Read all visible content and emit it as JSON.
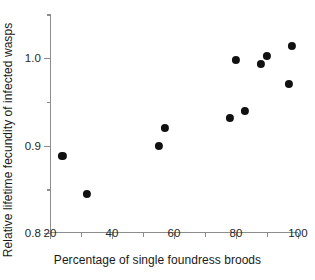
{
  "chart_data": {
    "type": "scatter",
    "title": "",
    "xlabel": "Percentage of single foundress broods",
    "ylabel": "Relative lifetime fecundity of infected wasps",
    "xlim": [
      20,
      100
    ],
    "ylim": [
      0.8,
      1.05
    ],
    "grid": false,
    "legend": null,
    "x_ticks_major": [
      20,
      40,
      60,
      80,
      100
    ],
    "x_ticks_minor": [
      30,
      50,
      70,
      90
    ],
    "x_tick_labels": [
      "20",
      "40",
      "60",
      "80",
      "100"
    ],
    "y_ticks_major": [
      0.8,
      0.9,
      1.0
    ],
    "y_ticks_minor": [
      0.85,
      0.95,
      1.05
    ],
    "y_tick_labels": [
      "0.8",
      "0.9",
      "1.0"
    ],
    "marker": "filled-circle",
    "marker_color": "#111111",
    "axis_color": "#8d8d8d",
    "points": [
      {
        "x": 24,
        "y": 0.888
      },
      {
        "x": 32,
        "y": 0.845
      },
      {
        "x": 55,
        "y": 0.9
      },
      {
        "x": 57,
        "y": 0.92
      },
      {
        "x": 78,
        "y": 0.932
      },
      {
        "x": 80,
        "y": 0.998
      },
      {
        "x": 83,
        "y": 0.94
      },
      {
        "x": 88,
        "y": 0.993
      },
      {
        "x": 90,
        "y": 1.002
      },
      {
        "x": 97,
        "y": 0.97
      },
      {
        "x": 98,
        "y": 1.014
      }
    ]
  }
}
